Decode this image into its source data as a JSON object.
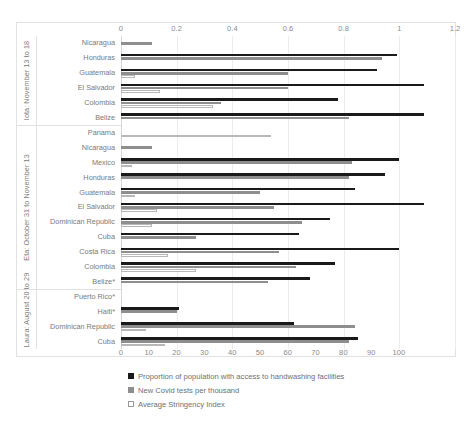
{
  "chart_data": {
    "type": "bar",
    "orientation": "horizontal",
    "title": "",
    "subtitle": "",
    "xlabel": "",
    "ylabel": "",
    "grid": true,
    "legend_position": "bottom-left",
    "axes": {
      "top": {
        "label": "",
        "lim": [
          0,
          1.2
        ],
        "ticks": [
          "0",
          "0.2",
          "0.4",
          "0.6",
          "0.8",
          "1",
          "1.2"
        ],
        "tick_values": [
          0,
          0.2,
          0.4,
          0.6,
          0.8,
          1,
          1.2
        ],
        "applies_to": "Proportion of population with access to handwashing facilities"
      },
      "bottom": {
        "label": "",
        "lim": [
          0,
          100
        ],
        "ticks": [
          "0",
          "10",
          "20",
          "30",
          "40",
          "50",
          "60",
          "70",
          "80",
          "90",
          "100"
        ],
        "tick_values": [
          0,
          10,
          20,
          30,
          40,
          50,
          60,
          70,
          80,
          90,
          100
        ],
        "applies_to": "New Covid tests per thousand / Average Stringency Index"
      }
    },
    "series": [
      {
        "name": "Proportion of population with access to handwashing facilities",
        "color": "#1a1a1a",
        "axis": "top"
      },
      {
        "name": "New Covid tests per thousand",
        "color": "#8e8e8e",
        "axis": "bottom"
      },
      {
        "name": "Average Stringency Index",
        "color": "#ffffff",
        "axis": "bottom"
      }
    ],
    "groups": [
      {
        "label": "Iota: November 13 to 18",
        "categories": [
          {
            "name": "Nicaragua",
            "handwashing": null,
            "tests": 11.0,
            "stringency": null
          },
          {
            "name": "Honduras",
            "handwashing": 0.99,
            "tests": 94.0,
            "stringency": null
          },
          {
            "name": "Guatemala",
            "handwashing": 0.92,
            "tests": 60.0,
            "stringency": 5.0
          },
          {
            "name": "El Salvador",
            "handwashing": 1.09,
            "tests": 60.0,
            "stringency": 14.0
          },
          {
            "name": "Colombia",
            "handwashing": 0.78,
            "tests": 36.0,
            "stringency": 33.0
          },
          {
            "name": "Belize",
            "handwashing": 1.09,
            "tests": 82.0,
            "stringency": null
          }
        ]
      },
      {
        "label": "Eta: October 31 to November 13",
        "categories": [
          {
            "name": "Panama",
            "handwashing": null,
            "tests": null,
            "stringency": 54.0
          },
          {
            "name": "Nicaragua",
            "handwashing": null,
            "tests": 11.0,
            "stringency": null
          },
          {
            "name": "Mexico",
            "handwashing": 1.0,
            "tests": 83.0,
            "stringency": 4.0
          },
          {
            "name": "Honduras",
            "handwashing": 0.95,
            "tests": 82.0,
            "stringency": null
          },
          {
            "name": "Guatemala",
            "handwashing": 0.84,
            "tests": 50.0,
            "stringency": 5.0
          },
          {
            "name": "El Salvador",
            "handwashing": 1.09,
            "tests": 55.0,
            "stringency": 13.0
          },
          {
            "name": "Dominican Republic",
            "handwashing": 0.75,
            "tests": 65.0,
            "stringency": 11.0
          },
          {
            "name": "Cuba",
            "handwashing": 0.64,
            "tests": 27.0,
            "stringency": null
          },
          {
            "name": "Costa Rica",
            "handwashing": 1.0,
            "tests": 57.0,
            "stringency": 17.0
          },
          {
            "name": "Colombia",
            "handwashing": 0.77,
            "tests": 63.0,
            "stringency": 27.0
          },
          {
            "name": "Belize*",
            "handwashing": 0.68,
            "tests": 53.0,
            "stringency": null
          }
        ]
      },
      {
        "label": "Laura: August 20 to 29",
        "categories": [
          {
            "name": "Puerto Rico*",
            "handwashing": null,
            "tests": null,
            "stringency": null
          },
          {
            "name": "Haiti*",
            "handwashing": 0.21,
            "tests": 20.0,
            "stringency": null
          },
          {
            "name": "Dominican Republic",
            "handwashing": 0.62,
            "tests": 84.0,
            "stringency": 9.0
          },
          {
            "name": "Cuba",
            "handwashing": 0.85,
            "tests": 82.0,
            "stringency": 16.0
          }
        ]
      }
    ]
  }
}
